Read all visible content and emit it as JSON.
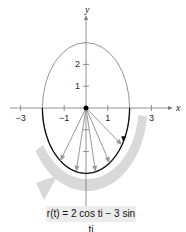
{
  "diagram": {
    "axes": {
      "x_label": "x",
      "y_label": "y"
    },
    "x_ticks": [
      {
        "value": -3,
        "label": "−3"
      },
      {
        "value": -1,
        "label": "−1"
      },
      {
        "value": 1,
        "label": "1"
      },
      {
        "value": 3,
        "label": "3"
      }
    ],
    "y_ticks": [
      {
        "value": 1,
        "label": "1"
      },
      {
        "value": 2,
        "label": "2"
      }
    ],
    "y_minor_ticks": [
      -1,
      -2
    ],
    "ellipse": {
      "a": 2,
      "b": 3
    },
    "vectors_t": [
      0.6,
      1.0,
      1.35,
      1.8,
      2.2
    ],
    "highlight_arc": {
      "t_start": 0,
      "t_end": 3.14159
    },
    "caption": "r(t) = 2 cos ti − 3 sin tj",
    "colors": {
      "ellipse": "#888888",
      "arc": "#111111",
      "vectors": "#999999",
      "sweep": "#d9d9d9",
      "axis": "#777777"
    }
  }
}
